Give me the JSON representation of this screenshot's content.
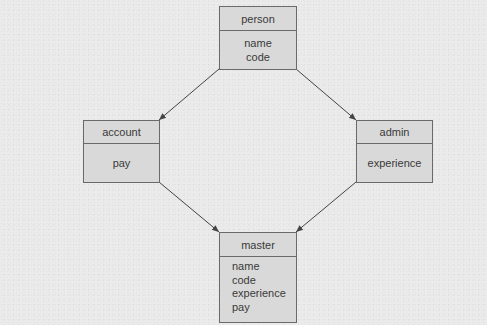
{
  "diagram": {
    "type": "class-diagram",
    "classes": {
      "person": {
        "name": "person",
        "attributes": [
          "name",
          "code"
        ]
      },
      "account": {
        "name": "account",
        "attributes": [
          "pay"
        ]
      },
      "admin": {
        "name": "admin",
        "attributes": [
          "experience"
        ]
      },
      "master": {
        "name": "master",
        "attributes": [
          "name",
          "code",
          "experience",
          "pay"
        ]
      }
    },
    "edges": [
      {
        "from": "person",
        "to": "account"
      },
      {
        "from": "person",
        "to": "admin"
      },
      {
        "from": "account",
        "to": "master"
      },
      {
        "from": "admin",
        "to": "master"
      }
    ],
    "colors": {
      "box_fill": "#d9d9d9",
      "box_border": "#6a6a6a",
      "line": "#444444",
      "background": "#ebebeb"
    }
  }
}
